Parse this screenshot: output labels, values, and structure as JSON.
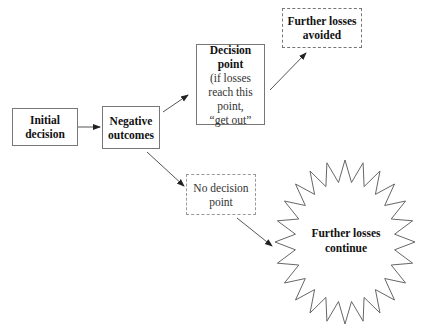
{
  "nodes": {
    "initial_decision": {
      "line1": "Initial",
      "line2": "decision"
    },
    "negative_outcomes": {
      "line1": "Negative",
      "line2": "outcomes"
    },
    "decision_point": {
      "title1": "Decision",
      "title2": "point",
      "note1": "(if losses",
      "note2": "reach this",
      "note3": "point,",
      "note4": "“get out”"
    },
    "further_losses_avoided": {
      "line1": "Further losses",
      "line2": "avoided"
    },
    "no_decision_point": {
      "line1": "No decision",
      "line2": "point"
    },
    "further_losses_continue": {
      "line1": "Further losses",
      "line2": "continue"
    }
  },
  "edges": [
    {
      "from": "initial_decision",
      "to": "negative_outcomes"
    },
    {
      "from": "negative_outcomes",
      "to": "decision_point"
    },
    {
      "from": "negative_outcomes",
      "to": "no_decision_point"
    },
    {
      "from": "decision_point",
      "to": "further_losses_avoided"
    },
    {
      "from": "no_decision_point",
      "to": "further_losses_continue"
    }
  ],
  "colors": {
    "line": "#555555",
    "border": "#777777",
    "text": "#111111"
  }
}
